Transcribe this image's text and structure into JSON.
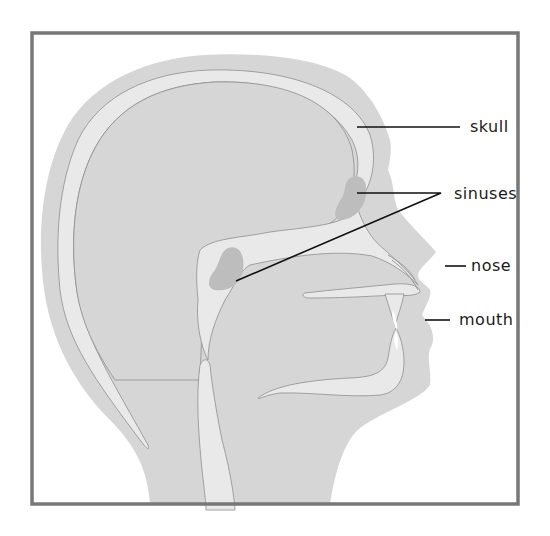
{
  "diagram": {
    "colors": {
      "frame": "#777777",
      "skin": "#d6d6d6",
      "bone": "#e9e9e9",
      "sinus": "#bdbdbd",
      "outline": "#8e8e8e",
      "leader": "#111111",
      "text": "#1a1a1a"
    },
    "labels": [
      {
        "id": "skull",
        "text": "skull"
      },
      {
        "id": "sinuses",
        "text": "sinuses"
      },
      {
        "id": "nose",
        "text": "nose"
      },
      {
        "id": "mouth",
        "text": "mouth"
      }
    ]
  }
}
